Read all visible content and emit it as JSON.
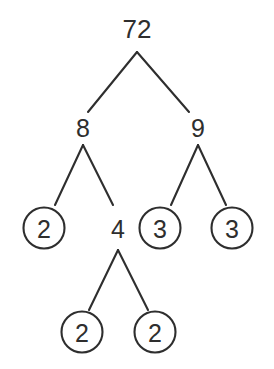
{
  "diagram": {
    "type": "factor-tree",
    "background_color": "#ffffff",
    "stroke_color": "#2e2e2e",
    "text_color": "#2e2e2e",
    "circle_radius": 20.5,
    "canvas": {
      "width": 274,
      "height": 369
    }
  },
  "nodes": [
    {
      "id": "n72",
      "label": "72",
      "x": 137,
      "y": 28,
      "circled": false,
      "font_size": 26,
      "level": 0
    },
    {
      "id": "n8",
      "label": "8",
      "x": 83,
      "y": 127,
      "circled": false,
      "font_size": 25,
      "level": 1
    },
    {
      "id": "n9",
      "label": "9",
      "x": 198,
      "y": 127,
      "circled": false,
      "font_size": 25,
      "level": 1
    },
    {
      "id": "n2a",
      "label": "2",
      "x": 44,
      "y": 228,
      "circled": true,
      "font_size": 25,
      "level": 2
    },
    {
      "id": "n4",
      "label": "4",
      "x": 118,
      "y": 228,
      "circled": false,
      "font_size": 25,
      "level": 2
    },
    {
      "id": "n3a",
      "label": "3",
      "x": 160,
      "y": 228,
      "circled": true,
      "font_size": 25,
      "level": 2
    },
    {
      "id": "n3b",
      "label": "3",
      "x": 232,
      "y": 228,
      "circled": true,
      "font_size": 25,
      "level": 2
    },
    {
      "id": "n2b",
      "label": "2",
      "x": 82,
      "y": 332,
      "circled": true,
      "font_size": 25,
      "level": 3
    },
    {
      "id": "n2c",
      "label": "2",
      "x": 155,
      "y": 332,
      "circled": true,
      "font_size": 25,
      "level": 3
    }
  ],
  "edges": [
    {
      "id": "e72-8",
      "from": "n72",
      "to": "n8",
      "x1": 137,
      "y1": 52,
      "x2": 88,
      "y2": 112
    },
    {
      "id": "e72-9",
      "from": "n72",
      "to": "n9",
      "x1": 137,
      "y1": 52,
      "x2": 189,
      "y2": 112
    },
    {
      "id": "e8-2",
      "from": "n8",
      "to": "n2a",
      "x1": 83,
      "y1": 145,
      "x2": 55,
      "y2": 205
    },
    {
      "id": "e8-4",
      "from": "n8",
      "to": "n4",
      "x1": 83,
      "y1": 145,
      "x2": 113,
      "y2": 205
    },
    {
      "id": "e9-3a",
      "from": "n9",
      "to": "n3a",
      "x1": 198,
      "y1": 145,
      "x2": 171,
      "y2": 205
    },
    {
      "id": "e9-3b",
      "from": "n9",
      "to": "n3b",
      "x1": 198,
      "y1": 145,
      "x2": 226,
      "y2": 205
    },
    {
      "id": "e4-2b",
      "from": "n4",
      "to": "n2b",
      "x1": 118,
      "y1": 250,
      "x2": 89,
      "y2": 310
    },
    {
      "id": "e4-2c",
      "from": "n4",
      "to": "n2c",
      "x1": 118,
      "y1": 250,
      "x2": 148,
      "y2": 310
    }
  ],
  "chart_data": {
    "type": "diagram",
    "root": 72,
    "factorization": [
      2,
      2,
      2,
      3,
      3
    ],
    "tree": {
      "value": 72,
      "prime": false,
      "children": [
        {
          "value": 8,
          "prime": false,
          "children": [
            {
              "value": 2,
              "prime": true,
              "children": []
            },
            {
              "value": 4,
              "prime": false,
              "children": [
                {
                  "value": 2,
                  "prime": true,
                  "children": []
                },
                {
                  "value": 2,
                  "prime": true,
                  "children": []
                }
              ]
            }
          ]
        },
        {
          "value": 9,
          "prime": false,
          "children": [
            {
              "value": 3,
              "prime": true,
              "children": []
            },
            {
              "value": 3,
              "prime": true,
              "children": []
            }
          ]
        }
      ]
    }
  }
}
